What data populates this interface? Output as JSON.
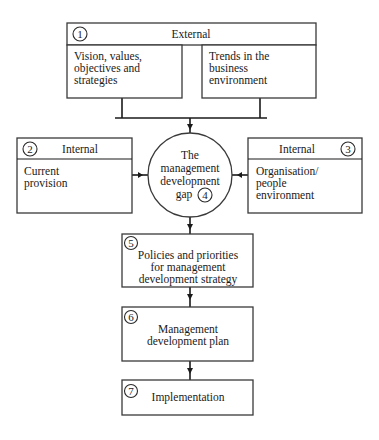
{
  "diagram": {
    "external": {
      "number": "1",
      "header": "External",
      "left_lines": [
        "Vision, values,",
        "objectives and",
        "strategies"
      ],
      "right_lines": [
        "Trends in the",
        "business",
        "environment"
      ]
    },
    "internal_left": {
      "number": "2",
      "header": "Internal",
      "lines": [
        "Current",
        "provision"
      ]
    },
    "internal_right": {
      "number": "3",
      "header": "Internal",
      "lines": [
        "Organisation/",
        "people",
        "environment"
      ]
    },
    "gap": {
      "number": "4",
      "lines": [
        "The",
        "management",
        "development",
        "gap"
      ]
    },
    "policies": {
      "number": "5",
      "lines": [
        "Policies and priorities",
        "for management",
        "development strategy"
      ]
    },
    "plan": {
      "number": "6",
      "lines": [
        "Management",
        "development plan"
      ]
    },
    "implementation": {
      "number": "7",
      "lines": [
        "Implementation"
      ]
    }
  }
}
